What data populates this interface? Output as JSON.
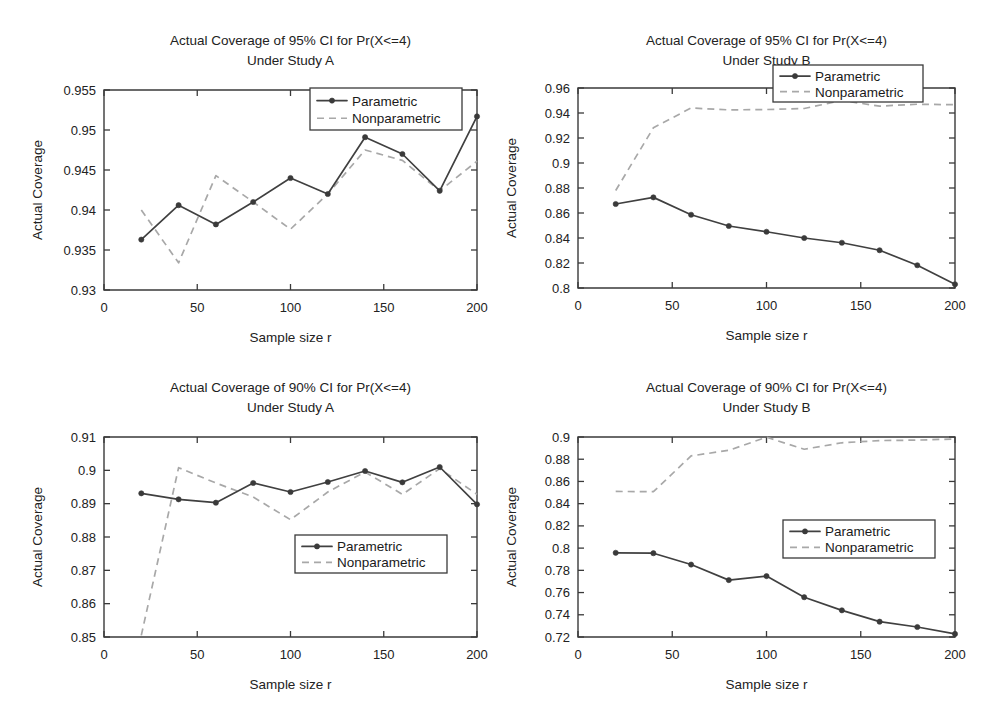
{
  "figure": {
    "background_color": "#ffffff",
    "panel_count": 4,
    "series_colors": {
      "parametric": "#404040",
      "nonparametric": "#a8a8a8"
    },
    "legend": {
      "parametric_label": "Parametric",
      "nonparametric_label": "Nonparametric"
    },
    "common_xlabel": "Sample size r",
    "common_ylabel": "Actual Coverage"
  },
  "chart_data": [
    {
      "id": "top-left",
      "type": "line",
      "title": "Actual Coverage of 95% CI for Pr(X<=4)",
      "subtitle": "Under Study A",
      "title_line1": "Actual Coverage of 95% CI for Pr(X<=4)",
      "title_line2": "Under Study A",
      "xlabel": "Sample size r",
      "ylabel": "Actual Coverage",
      "xlim": [
        0,
        200
      ],
      "ylim": [
        0.93,
        0.955
      ],
      "xticks": [
        0,
        50,
        100,
        150,
        200
      ],
      "xticklabels": [
        "0",
        "50",
        "100",
        "150",
        "200"
      ],
      "yticks": [
        0.93,
        0.935,
        0.94,
        0.945,
        0.95,
        0.955
      ],
      "yticklabels": [
        "0.93",
        "0.935",
        "0.94",
        "0.945",
        "0.95",
        "0.955"
      ],
      "grid": false,
      "legend_position": "top-right",
      "x": [
        20,
        40,
        60,
        80,
        100,
        120,
        140,
        160,
        180,
        200
      ],
      "series": [
        {
          "name": "Parametric",
          "style": "solid-markers",
          "values": [
            0.9363,
            0.9406,
            0.9382,
            0.941,
            0.944,
            0.942,
            0.9491,
            0.947,
            0.9424,
            0.9517
          ]
        },
        {
          "name": "Nonparametric",
          "style": "dashed",
          "values": [
            0.94,
            0.9334,
            0.9443,
            0.941,
            0.9376,
            0.942,
            0.9475,
            0.9462,
            0.9424,
            0.9461
          ]
        }
      ]
    },
    {
      "id": "top-right",
      "type": "line",
      "title": "Actual Coverage of 95% CI for Pr(X<=4)",
      "subtitle": "Under Study B",
      "title_line1": "Actual Coverage of 95% CI for Pr(X<=4)",
      "title_line2": "Under Study B",
      "xlabel": "Sample size r",
      "ylabel": "Actual Coverage",
      "xlim": [
        0,
        200
      ],
      "ylim": [
        0.8,
        0.96
      ],
      "xticks": [
        0,
        50,
        100,
        150,
        200
      ],
      "xticklabels": [
        "0",
        "50",
        "100",
        "150",
        "200"
      ],
      "yticks": [
        0.8,
        0.82,
        0.84,
        0.86,
        0.88,
        0.9,
        0.92,
        0.94,
        0.96
      ],
      "yticklabels": [
        "0.8",
        "0.82",
        "0.84",
        "0.86",
        "0.88",
        "0.9",
        "0.92",
        "0.94",
        "0.96"
      ],
      "grid": false,
      "legend_position": "middle-right",
      "x": [
        20,
        40,
        60,
        80,
        100,
        120,
        140,
        160,
        180,
        200
      ],
      "series": [
        {
          "name": "Parametric",
          "style": "solid-markers",
          "values": [
            0.8672,
            0.8725,
            0.8586,
            0.8496,
            0.845,
            0.84,
            0.8362,
            0.8302,
            0.8182,
            0.803
          ]
        },
        {
          "name": "Nonparametric",
          "style": "dashed",
          "values": [
            0.878,
            0.9282,
            0.944,
            0.9425,
            0.9428,
            0.9436,
            0.95,
            0.9455,
            0.947,
            0.9466
          ]
        }
      ]
    },
    {
      "id": "bottom-left",
      "type": "line",
      "title": "Actual Coverage of 90% CI for Pr(X<=4)",
      "subtitle": "Under Study A",
      "title_line1": "Actual Coverage of 90% CI for Pr(X<=4)",
      "title_line2": "Under Study A",
      "xlabel": "Sample size r",
      "ylabel": "Actual Coverage",
      "xlim": [
        0,
        200
      ],
      "ylim": [
        0.85,
        0.91
      ],
      "xticks": [
        0,
        50,
        100,
        150,
        200
      ],
      "xticklabels": [
        "0",
        "50",
        "100",
        "150",
        "200"
      ],
      "yticks": [
        0.85,
        0.86,
        0.87,
        0.88,
        0.89,
        0.9,
        0.91
      ],
      "yticklabels": [
        "0.85",
        "0.86",
        "0.87",
        "0.88",
        "0.89",
        "0.9",
        "0.91"
      ],
      "grid": false,
      "legend_position": "center-right",
      "x": [
        20,
        40,
        60,
        80,
        100,
        120,
        140,
        160,
        180,
        200
      ],
      "series": [
        {
          "name": "Parametric",
          "style": "solid-markers",
          "values": [
            0.8931,
            0.8913,
            0.8903,
            0.8962,
            0.8935,
            0.8965,
            0.8998,
            0.8964,
            0.901,
            0.8898
          ]
        },
        {
          "name": "Nonparametric",
          "style": "dashed",
          "values": [
            0.8505,
            0.9008,
            0.8962,
            0.892,
            0.8852,
            0.8935,
            0.8995,
            0.8928,
            0.9005,
            0.8928
          ]
        }
      ]
    },
    {
      "id": "bottom-right",
      "type": "line",
      "title": "Actual Coverage of 90% CI for Pr(X<=4)",
      "subtitle": "Under Study B",
      "title_line1": "Actual Coverage of 90% CI for Pr(X<=4)",
      "title_line2": "Under Study B",
      "xlabel": "Sample size r",
      "ylabel": "Actual Coverage",
      "xlim": [
        0.72,
        0.9
      ],
      "ylim": [
        0.72,
        0.9
      ],
      "xticks": [
        0,
        50,
        100,
        150,
        200
      ],
      "xticklabels": [
        "0",
        "50",
        "100",
        "150",
        "200"
      ],
      "yticks": [
        0.72,
        0.74,
        0.76,
        0.78,
        0.8,
        0.82,
        0.84,
        0.86,
        0.88,
        0.9
      ],
      "yticklabels": [
        "0.72",
        "0.74",
        "0.76",
        "0.78",
        "0.8",
        "0.82",
        "0.84",
        "0.86",
        "0.88",
        "0.9"
      ],
      "grid": false,
      "legend_position": "center-right",
      "x": [
        20,
        40,
        60,
        80,
        100,
        120,
        140,
        160,
        180,
        200
      ],
      "series": [
        {
          "name": "Parametric",
          "style": "solid-markers",
          "values": [
            0.7958,
            0.7954,
            0.7852,
            0.7712,
            0.7748,
            0.7558,
            0.744,
            0.7338,
            0.729,
            0.7228
          ]
        },
        {
          "name": "Nonparametric",
          "style": "dashed",
          "values": [
            0.851,
            0.8508,
            0.883,
            0.888,
            0.8998,
            0.889,
            0.8948,
            0.8968,
            0.8972,
            0.8982
          ]
        }
      ]
    }
  ]
}
